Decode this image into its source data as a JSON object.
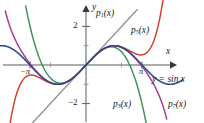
{
  "figure": {
    "type": "math-plot",
    "background": "#ffffff"
  },
  "axes": {
    "x_axis_label": "x",
    "y_axis_label": "y",
    "x_ticks": [
      {
        "label": "−π",
        "value": -3.14159
      },
      {
        "label": "π",
        "value": 3.14159
      }
    ],
    "y_ticks": [
      {
        "label": "2",
        "value": 2
      },
      {
        "label": "−2",
        "value": -2
      }
    ],
    "xlim": [
      -4.9,
      4.9
    ],
    "ylim": [
      -3.0,
      3.0
    ],
    "grid": false,
    "axis_color": "#5a5a5a"
  },
  "curves": [
    {
      "name": "sin",
      "label_html": "y = sin x",
      "label_plain": "y = sin x",
      "color": "#2c4a8c",
      "expression": "sin(x)"
    },
    {
      "name": "p1",
      "label_base": "p",
      "label_sub": "1",
      "label_tail": "(x)",
      "label_plain": "p1(x)",
      "color": "#8d8d8d",
      "expression": "x"
    },
    {
      "name": "p3",
      "label_base": "p",
      "label_sub": "3",
      "label_tail": "(x)",
      "label_plain": "p3(x)",
      "color": "#3c8f55",
      "expression": "x - x^3/6"
    },
    {
      "name": "p5",
      "label_base": "p",
      "label_sub": "5",
      "label_tail": "(x)",
      "label_plain": "p5(x)",
      "color": "#d33b27",
      "expression": "x - x^3/6 + x^5/120"
    },
    {
      "name": "p7",
      "label_base": "p",
      "label_sub": "7",
      "label_tail": "(x)",
      "label_plain": "p7(x)",
      "color": "#a8388f",
      "expression": "x - x^3/6 + x^5/120 - x^7/5040"
    }
  ],
  "chart_data": {
    "type": "line",
    "title": "",
    "xlabel": "x",
    "ylabel": "y",
    "xlim": [
      -4.9,
      4.9
    ],
    "ylim": [
      -3.0,
      3.0
    ],
    "grid": false,
    "legend": "inline-annotations",
    "xticks": {
      "values": [
        -3.14159,
        3.14159
      ],
      "labels": [
        "−π",
        "π"
      ]
    },
    "yticks": {
      "values": [
        2,
        -2
      ],
      "labels": [
        "2",
        "−2"
      ]
    },
    "series": [
      {
        "name": "y = sin x",
        "color": "#2c4a8c",
        "formula": "sin(x)",
        "x": [
          -4.9,
          -4.4,
          -3.9,
          -3.4,
          -2.9,
          -2.4,
          -1.9,
          -1.4,
          -0.9,
          -0.4,
          0,
          0.4,
          0.9,
          1.4,
          1.9,
          2.4,
          2.9,
          3.4,
          3.9,
          4.4,
          4.9
        ],
        "y": [
          0.982,
          0.952,
          0.688,
          0.256,
          -0.239,
          -0.675,
          -0.946,
          -0.985,
          -0.783,
          -0.389,
          0,
          0.389,
          0.783,
          0.985,
          0.946,
          0.675,
          0.239,
          -0.256,
          -0.688,
          -0.952,
          -0.982
        ]
      },
      {
        "name": "p1(x)",
        "color": "#8d8d8d",
        "formula": "x",
        "x": [
          -3.1,
          2.85
        ],
        "y": [
          -3.1,
          2.85
        ]
      },
      {
        "name": "p3(x)",
        "color": "#3c8f55",
        "formula": "x - x^3/6",
        "x": [
          -3.3,
          -2.8,
          -2.3,
          -1.8,
          -1.3,
          -0.8,
          0,
          0.8,
          1.3,
          1.8,
          2.3,
          2.8,
          3.3
        ],
        "y": [
          2.69,
          0.858,
          -0.272,
          -0.828,
          -0.934,
          -0.715,
          0,
          0.715,
          0.934,
          0.828,
          0.272,
          -0.858,
          -2.69
        ]
      },
      {
        "name": "p5(x)",
        "color": "#d33b27",
        "formula": "x - x^3/6 + x^5/120",
        "x": [
          -4.6,
          -4.1,
          -3.6,
          -3.1,
          -2.6,
          -2.1,
          -1.6,
          -1.1,
          -0.6,
          0,
          0.6,
          1.1,
          1.6,
          2.1,
          2.6,
          3.1,
          3.6,
          4.1,
          4.6
        ],
        "y": [
          -2.39,
          -0.3,
          0.63,
          0.9,
          0.8,
          0.65,
          0.63,
          0.89,
          0.56,
          0,
          -0.56,
          -0.89,
          -0.63,
          -0.65,
          -0.8,
          -0.9,
          -0.63,
          0.3,
          2.39
        ]
      },
      {
        "name": "p7(x)",
        "color": "#a8388f",
        "formula": "x - x^3/6 + x^5/120 - x^7/5040",
        "x": [
          -4.4,
          -3.9,
          -3.4,
          -2.9,
          -2.4,
          -1.9,
          -1.4,
          -0.9,
          -0.4,
          0,
          0.4,
          0.9,
          1.4,
          1.9,
          2.4,
          2.9,
          3.4,
          3.9,
          4.4
        ],
        "y": [
          2.59,
          1.05,
          0.33,
          -0.21,
          -0.67,
          -0.95,
          -0.985,
          -0.783,
          -0.389,
          0,
          0.389,
          0.783,
          0.985,
          0.95,
          0.67,
          0.21,
          -0.33,
          -1.05,
          -2.59
        ]
      }
    ]
  },
  "annotations": [
    {
      "id": "p1",
      "text": "p1(x)",
      "x_px": 96,
      "y_px": 10
    },
    {
      "id": "p5",
      "text": "p5(x)",
      "x_px": 131,
      "y_px": 27
    },
    {
      "id": "sin",
      "text": "y = sin x",
      "x_px": 152,
      "y_px": 76
    },
    {
      "id": "p3",
      "text": "p3(x)",
      "x_px": 114,
      "y_px": 101
    },
    {
      "id": "p7",
      "text": "p7(x)",
      "x_px": 168,
      "y_px": 101
    }
  ]
}
